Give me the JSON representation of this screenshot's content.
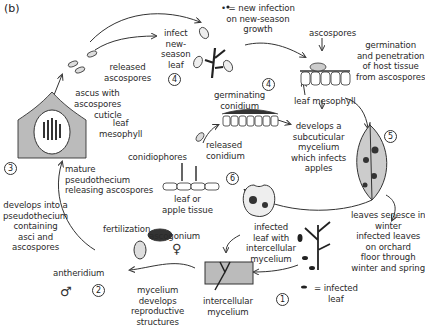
{
  "panel_label": "(b)",
  "legend": {
    "new_infection": "= new infection on new-season growth",
    "infected_leaf_1": "= infected",
    "infected_leaf_2": "leaf"
  },
  "stages": [
    "1",
    "2",
    "3",
    "4",
    "4",
    "5",
    "6"
  ],
  "symbols": {
    "female": "♀",
    "male": "♂"
  },
  "labels": {
    "released_ascospores": [
      "released",
      "ascospores"
    ],
    "infect_new_season_leaf": [
      "infect",
      "new-",
      "season",
      "leaf"
    ],
    "new_infection": [
      "• = new infection",
      "on new-season",
      "growth"
    ],
    "ascospores_top": "ascospores",
    "germination": [
      "germination",
      "and penetration",
      "of host tissue",
      "from ascospores"
    ],
    "leaf_mesophyll_right": "leaf mesophyll",
    "ascus_with_ascospores": [
      "ascus with",
      "ascospores"
    ],
    "cuticle": "cuticle",
    "leaf_mesophyll_left": [
      "leaf",
      "mesophyll"
    ],
    "germinating_conidium": [
      "germinating",
      "conidium"
    ],
    "subcuticular": [
      "develops a",
      "subcuticular",
      "mycelium",
      "which infects",
      "apples"
    ],
    "mature_pseudothecium": [
      "mature",
      "pseudothecium",
      "releasing ascospores"
    ],
    "released_conidium": [
      "released",
      "conidium"
    ],
    "conidiophores": "conidiophores",
    "leaf_or_apple_tissue": [
      "leaf or",
      "apple tissue"
    ],
    "develops_pseudothecium": [
      "develops into a",
      "pseudothecium",
      "containing",
      "asci and",
      "ascospores"
    ],
    "fertilization": "fertilization",
    "ascogonium": "ascogonium",
    "antheridium": "antheridium",
    "infected_leaf_intercellular": [
      "infected",
      "leaf with",
      "intercellular",
      "mycelium"
    ],
    "leaves_senesce": [
      "leaves senesce in",
      "winter",
      "infected leaves",
      "on orchard",
      "floor through",
      "winter and spring"
    ],
    "intercellular_mycelium": [
      "intercellular",
      "mycelium"
    ],
    "mycelium_develops": [
      "mycelium",
      "develops",
      "reproductive",
      "structures"
    ]
  }
}
